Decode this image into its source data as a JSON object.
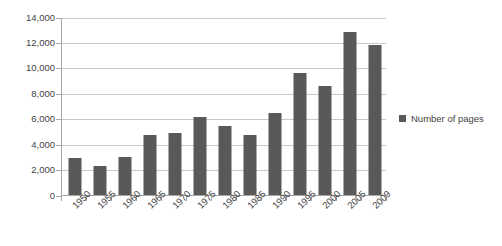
{
  "chart_data": {
    "type": "bar",
    "title": "",
    "subtitle": "",
    "xlabel": "",
    "ylabel": "",
    "categories": [
      "1950",
      "1955",
      "1960",
      "1965",
      "1970",
      "1975",
      "1980",
      "1985",
      "1990",
      "1995",
      "2000",
      "2005",
      "2009"
    ],
    "series": [
      {
        "name": "Number of pages",
        "values": [
          2950,
          2300,
          3000,
          4700,
          4850,
          6150,
          5400,
          4700,
          6450,
          9600,
          8600,
          12800,
          11800
        ],
        "color": "#595959"
      }
    ],
    "ylim": [
      0,
      14000
    ],
    "ytick_values": [
      0,
      2000,
      4000,
      6000,
      8000,
      10000,
      12000,
      14000
    ],
    "ytick_labels": [
      "0",
      "2,000",
      "4,000",
      "6,000",
      "8,000",
      "10,000",
      "12,000",
      "14,000"
    ],
    "grid": "horizontal",
    "legend_position": "right",
    "legend_entries": [
      "Number of pages"
    ],
    "annotations": [],
    "xtick_label_rotation": -45
  },
  "colors": {
    "bar": "#595959",
    "gridline": "#c8c8c8",
    "axis": "#a6a6a6",
    "text": "#3f3f3f",
    "background": "#ffffff"
  }
}
